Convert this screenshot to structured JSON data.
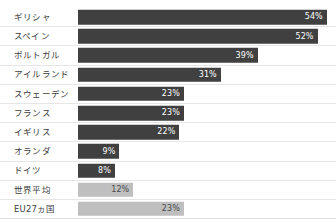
{
  "chart_data": {
    "type": "bar",
    "orientation": "horizontal",
    "title": "",
    "xlabel": "",
    "ylabel": "",
    "xlim": [
      0,
      56
    ],
    "grid": false,
    "legend": "none",
    "value_suffix": "%",
    "categories": [
      "ギリシャ",
      "スペイン",
      "ポルトガル",
      "アイルランド",
      "スウェーデン",
      "フランス",
      "イギリス",
      "オランダ",
      "ドイツ",
      "世界平均",
      "EU27ヵ国"
    ],
    "values": [
      54,
      52,
      39,
      31,
      23,
      23,
      22,
      9,
      8,
      12,
      23
    ],
    "value_labels": [
      "54%",
      "52%",
      "39%",
      "31%",
      "23%",
      "23%",
      "22%",
      "9%",
      "8%",
      "12%",
      "23%"
    ],
    "bar_styles": [
      "dark",
      "dark",
      "dark",
      "dark",
      "dark",
      "dark",
      "dark",
      "dark",
      "dark",
      "light",
      "light"
    ],
    "colors": {
      "bar_dark": "#404040",
      "bar_light": "#bfbfbf",
      "label_text": "#3d3d3d",
      "value_text_on_dark": "#ffffff",
      "value_text_on_light": "#4a4a4a",
      "row_separator": "#e6e6e6",
      "background": "#ffffff"
    }
  }
}
